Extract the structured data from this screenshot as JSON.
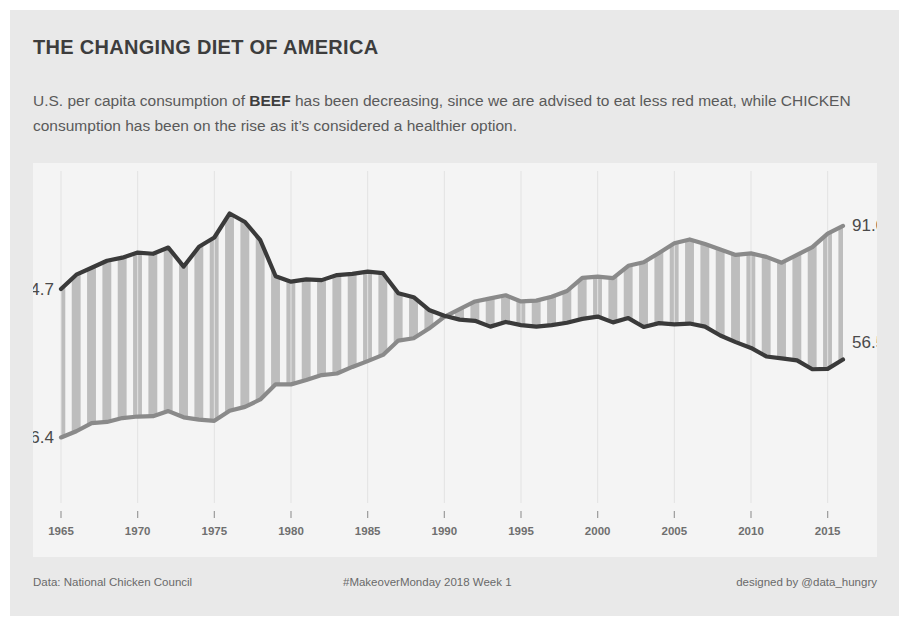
{
  "title": "THE CHANGING DIET OF AMERICA",
  "subtitle": {
    "part1": "U.S. per capita consumption of ",
    "beef_word": "BEEF",
    "part2": " has been decreasing, since we are advised to eat less red meat, while ",
    "chicken_word": "CHICKEN",
    "part3": " consumption has been on the rise as it’s considered a healthier option."
  },
  "footer": {
    "source": "Data: National Chicken Council",
    "project": "#MakeoverMonday 2018 Week 1",
    "credit": "designed by @data_hungry"
  },
  "colors": {
    "page_background": "#ffffff",
    "card_background": "#e9e9e9",
    "panel_background": "#f4f4f4",
    "beef_line": "#3a3a3a",
    "chicken_line": "#8a8a8a",
    "stripe_fill": "#bdbdbd",
    "tick_text": "#6f6f6f",
    "label_text": "#4a4a4a",
    "title_text": "#3d3d3d",
    "subtitle_text": "#5a5a5a"
  },
  "chart_data": {
    "type": "line",
    "title": "THE CHANGING DIET OF AMERICA",
    "xlabel": "",
    "ylabel": "",
    "xlim": [
      1965,
      2016
    ],
    "ylim": [
      20,
      100
    ],
    "grid": false,
    "legend": "none",
    "tick_labels": [
      "1965",
      "1970",
      "1975",
      "1980",
      "1985",
      "1990",
      "1995",
      "2000",
      "2005",
      "2010",
      "2015"
    ],
    "x": [
      1965,
      1966,
      1967,
      1968,
      1969,
      1970,
      1971,
      1972,
      1973,
      1974,
      1975,
      1976,
      1977,
      1978,
      1979,
      1980,
      1981,
      1982,
      1983,
      1984,
      1985,
      1986,
      1987,
      1988,
      1989,
      1990,
      1991,
      1992,
      1993,
      1994,
      1995,
      1996,
      1997,
      1998,
      1999,
      2000,
      2001,
      2002,
      2003,
      2004,
      2005,
      2006,
      2007,
      2008,
      2009,
      2010,
      2011,
      2012,
      2013,
      2014,
      2015,
      2016
    ],
    "series": [
      {
        "name": "BEEF",
        "color": "#3a3a3a",
        "start_label": "74.7",
        "end_label": "56.5",
        "values": [
          74.7,
          78.4,
          80.2,
          82.0,
          82.8,
          84.1,
          83.8,
          85.4,
          80.5,
          85.6,
          88.0,
          94.2,
          92.0,
          87.3,
          78.0,
          76.6,
          77.2,
          77.0,
          78.3,
          78.6,
          79.2,
          78.8,
          73.6,
          72.6,
          69.3,
          67.8,
          66.8,
          66.5,
          65.0,
          66.2,
          65.4,
          65.0,
          65.4,
          66.0,
          67.0,
          67.6,
          66.1,
          67.2,
          64.9,
          65.9,
          65.6,
          65.8,
          65.0,
          62.7,
          61.0,
          59.5,
          57.3,
          56.8,
          56.3,
          54.0,
          54.1,
          56.5
        ]
      },
      {
        "name": "CHICKEN",
        "color": "#8a8a8a",
        "start_label": "36.4",
        "end_label": "91.0",
        "values": [
          36.4,
          38.0,
          40.1,
          40.4,
          41.4,
          41.8,
          41.9,
          43.2,
          41.6,
          41.0,
          40.7,
          43.3,
          44.3,
          46.2,
          50.1,
          50.1,
          51.2,
          52.5,
          52.9,
          54.6,
          56.1,
          57.7,
          61.4,
          62.0,
          64.5,
          67.5,
          69.5,
          71.5,
          72.3,
          73.1,
          71.5,
          71.7,
          72.7,
          74.2,
          77.6,
          77.9,
          77.5,
          80.7,
          81.6,
          84.0,
          86.5,
          87.5,
          86.3,
          84.9,
          83.5,
          83.9,
          83.0,
          81.5,
          83.5,
          85.5,
          89.0,
          91.0
        ]
      }
    ]
  }
}
